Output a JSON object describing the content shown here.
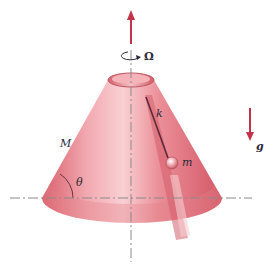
{
  "diagram": {
    "labels": {
      "omega": "Ω",
      "spring": "k",
      "mass": "m",
      "cone_mass": "M",
      "angle": "θ",
      "gravity": "g"
    },
    "colors": {
      "cone_light": "#f6c3c8",
      "cone_mid": "#e58a93",
      "cone_dark": "#c9505d",
      "arrow": "#c4334a",
      "axis_line": "#8a8a8a",
      "text": "#2a2a3a"
    }
  }
}
